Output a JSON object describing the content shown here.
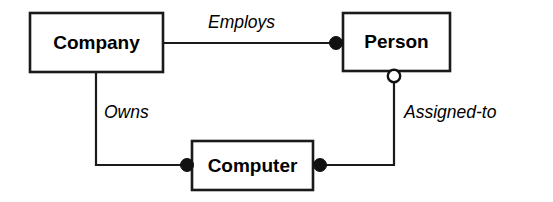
{
  "diagram": {
    "type": "entity-relationship-diagram",
    "title": "",
    "canvas": {
      "width": 553,
      "height": 202,
      "background": "#ffffff"
    },
    "colors": {
      "stroke": "#1a1a1a",
      "fill": "#ffffff",
      "text": "#000000",
      "marker_filled": "#111111",
      "marker_hollow_fill": "#ffffff"
    },
    "entities": [
      {
        "id": "company",
        "label": "Company",
        "x": 30,
        "y": 13,
        "width": 133,
        "height": 59
      },
      {
        "id": "person",
        "label": "Person",
        "x": 343,
        "y": 13,
        "width": 107,
        "height": 58
      },
      {
        "id": "computer",
        "label": "Computer",
        "x": 192,
        "y": 141,
        "width": 121,
        "height": 49
      }
    ],
    "relationships": [
      {
        "id": "employs",
        "label": "Employs",
        "from": "company",
        "to": "person",
        "label_x": 208,
        "label_y": 28,
        "path": "M 163 43 L 336 43",
        "markers": [
          {
            "kind": "filled-circle",
            "cx": 336,
            "cy": 43,
            "r": 6.5,
            "at": "person"
          }
        ]
      },
      {
        "id": "owns",
        "label": "Owns",
        "from": "company",
        "to": "computer",
        "label_x": 104,
        "label_y": 118,
        "path": "M 96 72 L 96 165 L 187 165",
        "markers": [
          {
            "kind": "filled-circle",
            "cx": 187,
            "cy": 165,
            "r": 6.5,
            "at": "computer"
          }
        ]
      },
      {
        "id": "assigned-to",
        "label": "Assigned-to",
        "from": "person",
        "to": "computer",
        "label_x": 404,
        "label_y": 118,
        "path": "M 394 76 L 394 165 L 320 165",
        "markers": [
          {
            "kind": "hollow-circle",
            "cx": 394,
            "cy": 76,
            "r": 6.2,
            "at": "person"
          },
          {
            "kind": "filled-circle",
            "cx": 320,
            "cy": 165,
            "r": 6.5,
            "at": "computer"
          }
        ]
      }
    ]
  }
}
